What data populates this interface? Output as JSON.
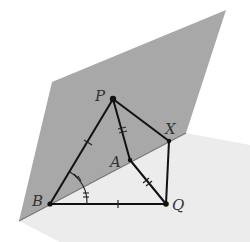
{
  "diagram": {
    "type": "3d-geometry",
    "colors": {
      "vertical_plane": "#a8a8a8",
      "horizontal_plane": "#ececec",
      "lines": "#111111",
      "labels": "#333333"
    },
    "points": {
      "P": {
        "label": "P",
        "x": 113,
        "y": 99
      },
      "X": {
        "label": "X",
        "x": 169,
        "y": 141
      },
      "A": {
        "label": "A",
        "x": 130,
        "y": 160
      },
      "B": {
        "label": "B",
        "x": 50,
        "y": 204
      },
      "Q": {
        "label": "Q",
        "x": 166,
        "y": 204
      }
    },
    "segments": [
      {
        "from": "P",
        "to": "B",
        "marks": 1
      },
      {
        "from": "P",
        "to": "A",
        "marks": 2
      },
      {
        "from": "P",
        "to": "X",
        "marks": 0
      },
      {
        "from": "A",
        "to": "Q",
        "marks": 2
      },
      {
        "from": "X",
        "to": "Q",
        "marks": 0
      },
      {
        "from": "B",
        "to": "Q",
        "marks": 1
      },
      {
        "from": "B",
        "to": "X",
        "marks": 0,
        "note": "intersection line of planes"
      }
    ],
    "angle_marks": [
      {
        "vertex": "B",
        "between": [
          "P",
          "A"
        ],
        "arcs": 2
      },
      {
        "vertex": "B",
        "between": [
          "A",
          "Q"
        ],
        "arcs": 2
      }
    ]
  }
}
